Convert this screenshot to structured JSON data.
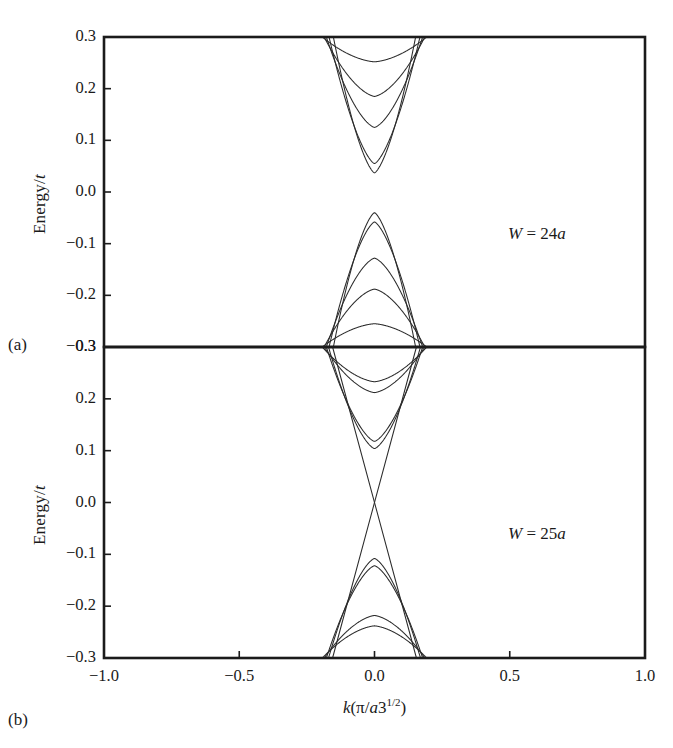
{
  "figure": {
    "panels": [
      {
        "letter": "(a)",
        "annotation_html": "W = 24a",
        "annotation_symbol": "W",
        "annotation_value": "24a",
        "ylabel": "Energy/t",
        "yticks": [
          "0.3",
          "0.2",
          "0.1",
          "0.0",
          "-0.1",
          "-0.2",
          "-0.3"
        ],
        "ytick_values": [
          0.3,
          0.2,
          0.1,
          0.0,
          -0.1,
          -0.2,
          -0.3
        ],
        "ylim": [
          -0.3,
          0.3
        ],
        "xlim": [
          -1.0,
          1.0
        ]
      },
      {
        "letter": "(b)",
        "annotation_html": "W = 25a",
        "annotation_symbol": "W",
        "annotation_value": "25a",
        "ylabel": "Energy/t",
        "yticks": [
          "0.3",
          "0.2",
          "0.1",
          "0.0",
          "-0.1",
          "-0.2",
          "-0.3"
        ],
        "ytick_values": [
          0.3,
          0.2,
          0.1,
          0.0,
          -0.1,
          -0.2,
          -0.3
        ],
        "ylim": [
          -0.3,
          0.3
        ],
        "xlim": [
          -1.0,
          1.0
        ]
      }
    ],
    "xticks": [
      "-1.0",
      "-0.5",
      "0.0",
      "0.5",
      "1.0"
    ],
    "xtick_values": [
      -1.0,
      -0.5,
      0.0,
      0.5,
      1.0
    ],
    "xlabel_parts": {
      "k": "k",
      "open": "(",
      "pi": "π",
      "slash": "/",
      "a": "a",
      "three": "3",
      "exp": "1/2",
      "close": ")"
    },
    "xlabel_plain": "k(π/a3^(1/2))"
  },
  "chart_data": [
    {
      "type": "line",
      "title": "",
      "subtitle": "",
      "panel": "(a)",
      "annotation": "W = 24a",
      "xlabel": "k(π/a3^(1/2))",
      "ylabel": "Energy/t",
      "xlim": [
        -1.0,
        1.0
      ],
      "ylim": [
        -0.3,
        0.3
      ],
      "xticks": [
        -1.0,
        -0.5,
        0.0,
        0.5,
        1.0
      ],
      "yticks": [
        -0.3,
        -0.2,
        -0.1,
        0.0,
        0.1,
        0.2,
        0.3
      ],
      "grid": false,
      "legend": "none",
      "description": "Semiconducting armchair nanoribbon band structure with an energy gap; nested electron and hole subbands symmetric about E=0.",
      "band_gap": 0.075,
      "conduction_band_minimum": 0.037,
      "valence_band_maximum": -0.04,
      "k_band_extent": [
        -0.195,
        0.195
      ],
      "series": [
        {
          "name": "c1",
          "type": "conduction",
          "vertex_k": 0.0,
          "vertex_E": 0.037,
          "edge_E": 0.3,
          "edge_k": 0.152,
          "flatness": 0.3
        },
        {
          "name": "c2",
          "type": "conduction",
          "vertex_k": 0.0,
          "vertex_E": 0.055,
          "edge_E": 0.3,
          "edge_k": 0.168,
          "flatness": 0.3
        },
        {
          "name": "c3",
          "type": "conduction",
          "vertex_k": 0.0,
          "vertex_E": 0.125,
          "edge_E": 0.3,
          "edge_k": 0.178,
          "flatness": 0.42
        },
        {
          "name": "c4",
          "type": "conduction",
          "vertex_k": 0.0,
          "vertex_E": 0.185,
          "edge_E": 0.3,
          "edge_k": 0.186,
          "flatness": 0.47
        },
        {
          "name": "c5",
          "type": "conduction",
          "vertex_k": 0.0,
          "vertex_E": 0.252,
          "edge_E": 0.3,
          "edge_k": 0.193,
          "flatness": 0.55
        },
        {
          "name": "v1",
          "type": "valence",
          "vertex_k": 0.0,
          "vertex_E": -0.04,
          "edge_E": -0.3,
          "edge_k": 0.152,
          "flatness": 0.3
        },
        {
          "name": "v2",
          "type": "valence",
          "vertex_k": 0.0,
          "vertex_E": -0.058,
          "edge_E": -0.3,
          "edge_k": 0.168,
          "flatness": 0.3
        },
        {
          "name": "v3",
          "type": "valence",
          "vertex_k": 0.0,
          "vertex_E": -0.128,
          "edge_E": -0.3,
          "edge_k": 0.178,
          "flatness": 0.42
        },
        {
          "name": "v4",
          "type": "valence",
          "vertex_k": 0.0,
          "vertex_E": -0.188,
          "edge_E": -0.3,
          "edge_k": 0.186,
          "flatness": 0.47
        },
        {
          "name": "v5",
          "type": "valence",
          "vertex_k": 0.0,
          "vertex_E": -0.255,
          "edge_E": -0.3,
          "edge_k": 0.193,
          "flatness": 0.55
        }
      ]
    },
    {
      "type": "line",
      "title": "",
      "subtitle": "",
      "panel": "(b)",
      "annotation": "W = 25a",
      "xlabel": "k(π/a3^(1/2))",
      "ylabel": "Energy/t",
      "xlim": [
        -1.0,
        1.0
      ],
      "ylim": [
        -0.3,
        0.3
      ],
      "xticks": [
        -1.0,
        -0.5,
        0.0,
        0.5,
        1.0
      ],
      "yticks": [
        -0.3,
        -0.2,
        -0.1,
        0.0,
        0.1,
        0.2,
        0.3
      ],
      "grid": false,
      "legend": "none",
      "description": "Metallic armchair nanoribbon band structure; two linear bands cross at the Dirac point k=0, E=0, with nested subbands above and below.",
      "band_gap": 0.0,
      "dirac_point": {
        "k": 0.0,
        "E": 0.0
      },
      "k_band_extent": [
        -0.195,
        0.195
      ],
      "series": [
        {
          "name": "linear+",
          "type": "linear",
          "slope_sign": 1,
          "through": {
            "k": 0.0,
            "E": 0.0
          },
          "edge_E": 0.3,
          "edge_k": 0.155
        },
        {
          "name": "linear-",
          "type": "linear",
          "slope_sign": -1,
          "through": {
            "k": 0.0,
            "E": 0.0
          },
          "edge_E": 0.3,
          "edge_k": 0.155
        },
        {
          "name": "c1",
          "type": "conduction",
          "vertex_k": 0.0,
          "vertex_E": 0.104,
          "edge_E": 0.3,
          "edge_k": 0.17,
          "flatness": 0.36
        },
        {
          "name": "c2",
          "type": "conduction",
          "vertex_k": 0.0,
          "vertex_E": 0.118,
          "edge_E": 0.3,
          "edge_k": 0.178,
          "flatness": 0.36
        },
        {
          "name": "c3",
          "type": "conduction",
          "vertex_k": 0.0,
          "vertex_E": 0.212,
          "edge_E": 0.3,
          "edge_k": 0.186,
          "flatness": 0.5
        },
        {
          "name": "c4",
          "type": "conduction",
          "vertex_k": 0.0,
          "vertex_E": 0.233,
          "edge_E": 0.3,
          "edge_k": 0.193,
          "flatness": 0.52
        },
        {
          "name": "v1",
          "type": "valence",
          "vertex_k": 0.0,
          "vertex_E": -0.108,
          "edge_E": -0.3,
          "edge_k": 0.17,
          "flatness": 0.36
        },
        {
          "name": "v2",
          "type": "valence",
          "vertex_k": 0.0,
          "vertex_E": -0.122,
          "edge_E": -0.3,
          "edge_k": 0.178,
          "flatness": 0.36
        },
        {
          "name": "v3",
          "type": "valence",
          "vertex_k": 0.0,
          "vertex_E": -0.218,
          "edge_E": -0.3,
          "edge_k": 0.186,
          "flatness": 0.5
        },
        {
          "name": "v4",
          "type": "valence",
          "vertex_k": 0.0,
          "vertex_E": -0.238,
          "edge_E": -0.3,
          "edge_k": 0.193,
          "flatness": 0.52
        }
      ]
    }
  ]
}
